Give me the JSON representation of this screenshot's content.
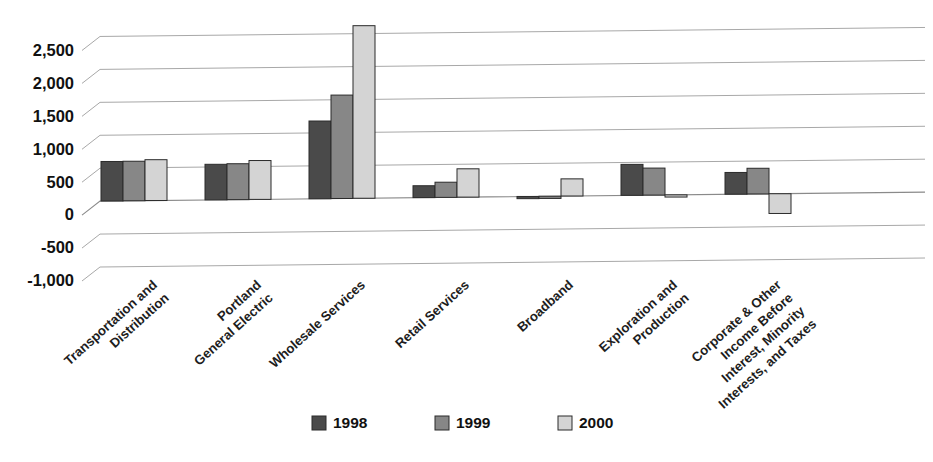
{
  "chart_data": {
    "type": "bar",
    "title": "",
    "subtitle": "",
    "xlabel": "",
    "ylabel": "",
    "grid": true,
    "legend_position": "bottom-center",
    "ylim": [
      -1000,
      2750
    ],
    "yticks": [
      -1000,
      -500,
      0,
      500,
      1000,
      1500,
      2000,
      2500
    ],
    "ytick_labels": [
      "-1,000",
      "-500",
      "0",
      "500",
      "1,000",
      "1,500",
      "2,000",
      "2,500"
    ],
    "categories": [
      "Transportation and Distribution",
      "Portland General Electric",
      "Wholesale Services",
      "Retail Services",
      "Broadband",
      "Exploration and Production",
      "Corporate & Other Income Before Interest, Minority Interests, and Taxes"
    ],
    "category_lines": [
      [
        "Transportation and",
        "Distribution"
      ],
      [
        "Portland",
        "General Electric"
      ],
      [
        "Wholesale Services"
      ],
      [
        "Retail Services"
      ],
      [
        "Broadband"
      ],
      [
        "Exploration and",
        "Production"
      ],
      [
        "Corporate & Other",
        "Income Before",
        "Interest, Minority",
        "Interests, and Taxes"
      ]
    ],
    "series": [
      {
        "name": "1998",
        "color": "#4a4a4a",
        "values": [
          600,
          540,
          1180,
          180,
          0,
          470,
          330
        ]
      },
      {
        "name": "1999",
        "color": "#878787",
        "values": [
          600,
          545,
          1570,
          230,
          0,
          410,
          390
        ]
      },
      {
        "name": "2000",
        "color": "#d4d4d4",
        "values": [
          620,
          590,
          2620,
          430,
          260,
          0,
          -300
        ]
      }
    ]
  },
  "legend": {
    "items": [
      {
        "label": "1998",
        "color": "#4a4a4a"
      },
      {
        "label": "1999",
        "color": "#878787"
      },
      {
        "label": "2000",
        "color": "#d4d4d4"
      }
    ]
  },
  "axis": {
    "ytick_labels": [
      "2,500",
      "2,000",
      "1,500",
      "1,000",
      "500",
      "0",
      "-500",
      "-1,000"
    ]
  },
  "colors": {
    "series_1998": "#4a4a4a",
    "series_1999": "#878787",
    "series_2000": "#d4d4d4",
    "gridline": "#a8a8a8",
    "bar_outline": "#2b2b2b",
    "background": "#ffffff",
    "text": "#111111"
  }
}
